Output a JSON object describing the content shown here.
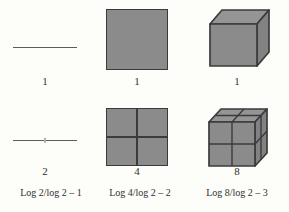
{
  "figure": {
    "columns": [
      {
        "shape": "line",
        "top": {
          "count": "1"
        },
        "bottom": {
          "count": "2",
          "formula": "Log 2/log 2 – 1"
        }
      },
      {
        "shape": "square",
        "top": {
          "count": "1"
        },
        "bottom": {
          "count": "4",
          "formula": "Log 4/log 2 – 2"
        }
      },
      {
        "shape": "cube",
        "top": {
          "count": "1"
        },
        "bottom": {
          "count": "8",
          "formula": "Log 8/log 2 – 3"
        }
      }
    ],
    "colors": {
      "background": "#fdfdfa",
      "shape_fill_front": "#8b8b8b",
      "shape_fill_top": "#959595",
      "shape_fill_side": "#828282",
      "stroke": "#3b3b3b",
      "line": "#5c5c5c",
      "text": "#2f2f2f"
    }
  }
}
